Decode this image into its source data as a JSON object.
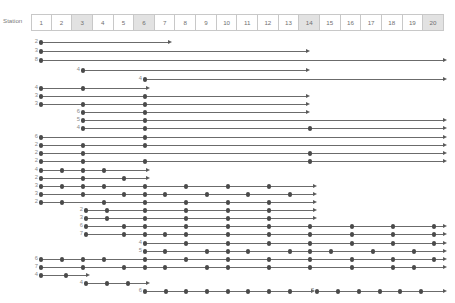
{
  "header": {
    "row_label": "Station",
    "stations": [
      "1",
      "2",
      "3",
      "4",
      "5",
      "6",
      "7",
      "8",
      "9",
      "10",
      "11",
      "12",
      "13",
      "14",
      "15",
      "16",
      "17",
      "18",
      "19",
      "20"
    ],
    "shaded_stations": [
      3,
      6,
      14,
      20
    ]
  },
  "colors": {
    "dot": "#4a4a4a",
    "line": "#6b6b6b",
    "arrow": "#5a5a5a",
    "label_text": "#8a8a8a",
    "header_text": "#6f6f6f",
    "cell_border": "#c8c8c8",
    "cell_shade": "#e2e2e2",
    "background": "#ffffff"
  },
  "chart_data": {
    "type": "scatter",
    "title": "",
    "xlabel": "Station",
    "ylabel": "",
    "grid": false,
    "legend": null,
    "x_axis": {
      "categories": [
        "1",
        "2",
        "3",
        "4",
        "5",
        "6",
        "7",
        "8",
        "9",
        "10",
        "11",
        "12",
        "13",
        "14",
        "15",
        "16",
        "17",
        "18",
        "19",
        "20"
      ],
      "highlighted": [
        3,
        6,
        14,
        20
      ]
    },
    "series": [
      {
        "name": "r1",
        "label": "2",
        "y": 42,
        "stops": [
          1
        ],
        "start": 1,
        "end_x": 172
      },
      {
        "name": "r2",
        "label": "3",
        "y": 51,
        "stops": [
          1
        ],
        "start": 1,
        "end_x": 310
      },
      {
        "name": "r3",
        "label": "8",
        "y": 60,
        "stops": [
          1
        ],
        "start": 1,
        "end_x": 447
      },
      {
        "name": "r4",
        "label": "4",
        "y": 70,
        "stops": [
          3
        ],
        "start": 3,
        "end_x": 310
      },
      {
        "name": "r5",
        "label": "4",
        "y": 79,
        "stops": [
          6
        ],
        "start": 6,
        "end_x": 447
      },
      {
        "name": "r6",
        "label": "4",
        "y": 88,
        "stops": [
          1,
          3
        ],
        "start": 1,
        "end_x": 150
      },
      {
        "name": "r7",
        "label": "3",
        "y": 96,
        "stops": [
          1,
          6
        ],
        "start": 1,
        "end_x": 310
      },
      {
        "name": "r8",
        "label": "3",
        "y": 104,
        "stops": [
          1,
          3,
          6
        ],
        "start": 1,
        "end_x": 310
      },
      {
        "name": "r9",
        "label": "6",
        "y": 112,
        "stops": [
          3,
          6
        ],
        "start": 3,
        "end_x": 310
      },
      {
        "name": "r10",
        "label": "5",
        "y": 120,
        "stops": [
          3,
          6
        ],
        "start": 3,
        "end_x": 447
      },
      {
        "name": "r11",
        "label": "4",
        "y": 128,
        "stops": [
          3,
          6,
          14
        ],
        "start": 3,
        "end_x": 447
      },
      {
        "name": "r12",
        "label": "6",
        "y": 137,
        "stops": [
          1,
          6
        ],
        "start": 1,
        "end_x": 447
      },
      {
        "name": "r13",
        "label": "2",
        "y": 145,
        "stops": [
          1,
          3,
          6
        ],
        "start": 1,
        "end_x": 447
      },
      {
        "name": "r14",
        "label": "2",
        "y": 153,
        "stops": [
          1,
          3,
          14
        ],
        "start": 1,
        "end_x": 447
      },
      {
        "name": "r15",
        "label": "2",
        "y": 161,
        "stops": [
          1,
          3,
          6,
          14
        ],
        "start": 1,
        "end_x": 447
      },
      {
        "name": "r16",
        "label": "4",
        "y": 170,
        "stops": [
          1,
          2,
          3,
          4
        ],
        "start": 1,
        "end_x": 150
      },
      {
        "name": "r17",
        "label": "2",
        "y": 178,
        "stops": [
          1,
          3,
          5
        ],
        "start": 1,
        "end_x": 150
      },
      {
        "name": "r18",
        "label": "3",
        "y": 186,
        "stops": [
          1,
          2,
          3,
          4,
          6,
          8,
          11,
          14
        ],
        "start": 1,
        "end_x": 317
      },
      {
        "name": "r19",
        "label": "3",
        "y": 194,
        "stops": [
          1,
          3,
          5,
          6,
          7,
          9,
          11,
          13
        ],
        "start": 1,
        "end_x": 317
      },
      {
        "name": "r20",
        "label": "2",
        "y": 202,
        "stops": [
          1,
          2,
          4,
          6,
          8,
          11,
          14
        ],
        "start": 1,
        "end_x": 317
      },
      {
        "name": "r21",
        "label": "2",
        "y": 210,
        "stops": [
          6,
          7,
          9,
          11,
          13
        ],
        "start": 6,
        "end_x": 317
      },
      {
        "name": "r22",
        "label": "3",
        "y": 218,
        "stops": [
          6,
          8,
          10,
          12,
          14
        ],
        "start": 6,
        "end_x": 317
      },
      {
        "name": "r23",
        "label": "6",
        "y": 226,
        "stops": [
          6,
          8,
          10,
          12,
          14,
          16,
          18
        ],
        "start": 6,
        "end_x": 447
      },
      {
        "name": "r24",
        "label": "7",
        "y": 234,
        "stops": [
          6,
          9,
          11,
          13,
          15,
          17,
          19
        ],
        "start": 6,
        "end_x": 447
      },
      {
        "name": "r25",
        "label": "4",
        "y": 243,
        "stops": [
          12,
          14,
          16,
          18,
          20
        ],
        "start": 12,
        "end_x": 447
      },
      {
        "name": "r26",
        "label": "5",
        "y": 251,
        "stops": [
          12,
          13,
          15,
          17,
          19
        ],
        "start": 12,
        "end_x": 447
      },
      {
        "name": "r27",
        "label": "6",
        "y": 243,
        "stops": [
          1,
          3,
          5,
          7
        ],
        "start": 1,
        "end_x": 447,
        "merge": "r26b"
      },
      {
        "name": "r28",
        "label": "7",
        "y": 259,
        "stops": [
          1,
          3,
          5,
          7,
          9,
          11,
          13,
          15,
          17,
          19
        ],
        "start": 1,
        "end_x": 447
      },
      {
        "name": "r29",
        "label": "4",
        "y": 267,
        "stops": [
          1,
          2
        ],
        "start": 1,
        "end_x": 90
      },
      {
        "name": "r30",
        "label": "4",
        "y": 275,
        "stops": [
          6,
          8,
          10
        ],
        "start": 6,
        "end_x": 150
      },
      {
        "name": "r31",
        "label": "6",
        "y": 283,
        "stops": [
          12,
          14,
          16,
          18,
          20,
          22,
          24,
          26
        ],
        "start": 12,
        "end_x": 315
      },
      {
        "name": "r32",
        "label": "7",
        "y": 291,
        "stops": [
          21,
          23,
          25,
          27,
          29,
          31
        ],
        "start": 21,
        "end_x": 447
      }
    ]
  },
  "rows": [
    {
      "label": "2",
      "y": 42,
      "sx": 41,
      "ex": 172,
      "dots": [
        41
      ]
    },
    {
      "label": "3",
      "y": 51,
      "sx": 41,
      "ex": 310,
      "dots": [
        41
      ]
    },
    {
      "label": "8",
      "y": 60,
      "sx": 41,
      "ex": 447,
      "dots": [
        41
      ]
    },
    {
      "label": "4",
      "y": 70,
      "sx": 83,
      "ex": 310,
      "dots": [
        83
      ]
    },
    {
      "label": "4",
      "y": 79,
      "sx": 145,
      "ex": 447,
      "dots": [
        145
      ]
    },
    {
      "label": "4",
      "y": 88,
      "sx": 41,
      "ex": 150,
      "dots": [
        41,
        83
      ]
    },
    {
      "label": "3",
      "y": 96,
      "sx": 41,
      "ex": 310,
      "dots": [
        41,
        145
      ]
    },
    {
      "label": "3",
      "y": 104,
      "sx": 41,
      "ex": 310,
      "dots": [
        41,
        83,
        145
      ]
    },
    {
      "label": "6",
      "y": 112,
      "sx": 83,
      "ex": 310,
      "dots": [
        83,
        145
      ]
    },
    {
      "label": "5",
      "y": 120,
      "sx": 83,
      "ex": 447,
      "dots": [
        83,
        145
      ]
    },
    {
      "label": "4",
      "y": 128,
      "sx": 83,
      "ex": 447,
      "dots": [
        83,
        145,
        310
      ]
    },
    {
      "label": "6",
      "y": 137,
      "sx": 41,
      "ex": 447,
      "dots": [
        41,
        145
      ]
    },
    {
      "label": "2",
      "y": 145,
      "sx": 41,
      "ex": 447,
      "dots": [
        41,
        83,
        145
      ]
    },
    {
      "label": "2",
      "y": 153,
      "sx": 41,
      "ex": 447,
      "dots": [
        41,
        83,
        310
      ]
    },
    {
      "label": "2",
      "y": 161,
      "sx": 41,
      "ex": 447,
      "dots": [
        41,
        83,
        145,
        310
      ]
    },
    {
      "label": "4",
      "y": 170,
      "sx": 41,
      "ex": 150,
      "dots": [
        41,
        62,
        83,
        104
      ]
    },
    {
      "label": "2",
      "y": 178,
      "sx": 41,
      "ex": 150,
      "dots": [
        41,
        83,
        124
      ]
    },
    {
      "label": "3",
      "y": 186,
      "sx": 41,
      "ex": 317,
      "dots": [
        41,
        62,
        83,
        104,
        145,
        186,
        228,
        269
      ]
    },
    {
      "label": "3",
      "y": 194,
      "sx": 41,
      "ex": 317,
      "dots": [
        41,
        83,
        124,
        145,
        165,
        207,
        248,
        290
      ]
    },
    {
      "label": "2",
      "y": 202,
      "sx": 41,
      "ex": 317,
      "dots": [
        41,
        62,
        104,
        145,
        186,
        228,
        269
      ]
    },
    {
      "label": "2",
      "y": 210,
      "sx": 86,
      "ex": 317,
      "dots": [
        86,
        107,
        145,
        186,
        228,
        269
      ]
    },
    {
      "label": "3",
      "y": 218,
      "sx": 86,
      "ex": 317,
      "dots": [
        86,
        107,
        145,
        186,
        228,
        269
      ]
    },
    {
      "label": "6",
      "y": 226,
      "sx": 86,
      "ex": 447,
      "dots": [
        86,
        124,
        145,
        186,
        228,
        269,
        310,
        352,
        393,
        434
      ]
    },
    {
      "label": "7",
      "y": 234,
      "sx": 86,
      "ex": 447,
      "dots": [
        86,
        124,
        145,
        165,
        186,
        228,
        269,
        310,
        352,
        393,
        434
      ]
    },
    {
      "label": "4",
      "y": 243,
      "sx": 145,
      "ex": 447,
      "dots": [
        145,
        186,
        228,
        269,
        310,
        352,
        393,
        434
      ]
    },
    {
      "label": "5",
      "y": 251,
      "sx": 145,
      "ex": 447,
      "dots": [
        145,
        165,
        207,
        228,
        248,
        290,
        310,
        331,
        373,
        414
      ]
    },
    {
      "label": "6",
      "y": 259,
      "sx": 41,
      "ex": 447,
      "dots": [
        41,
        62,
        83,
        104,
        145,
        186,
        228,
        269,
        310,
        352,
        393,
        434
      ]
    },
    {
      "label": "7",
      "y": 267,
      "sx": 41,
      "ex": 447,
      "dots": [
        41,
        83,
        124,
        145,
        165,
        207,
        228,
        269,
        310,
        352,
        393,
        414
      ]
    },
    {
      "label": "4",
      "y": 275,
      "sx": 41,
      "ex": 90,
      "dots": [
        41,
        66
      ]
    },
    {
      "label": "4",
      "y": 283,
      "sx": 86,
      "ex": 150,
      "dots": [
        86,
        107,
        128
      ]
    },
    {
      "label": "6",
      "y": 291,
      "sx": 145,
      "ex": 315,
      "dots": [
        145,
        166,
        186,
        207,
        228,
        248,
        269,
        290
      ]
    },
    {
      "label": "7",
      "y": 291,
      "sx": 317,
      "ex": 447,
      "dots": [
        317,
        338,
        359,
        380,
        400,
        421
      ]
    }
  ]
}
